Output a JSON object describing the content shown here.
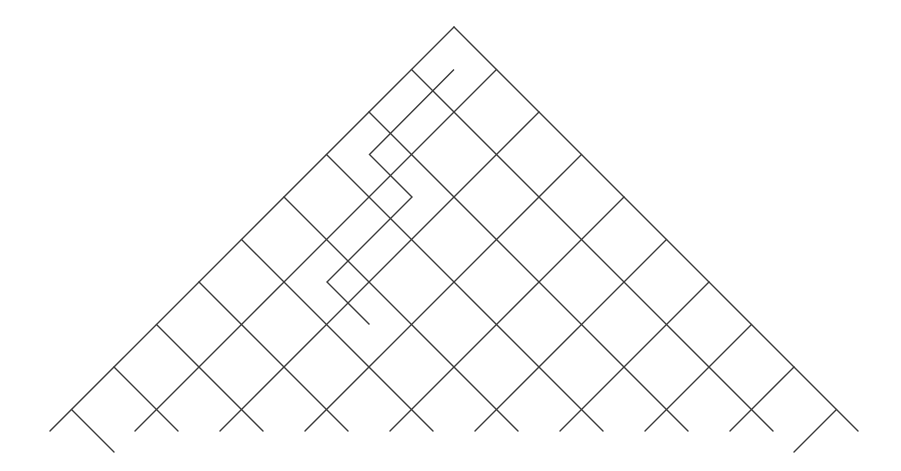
{
  "diagram": {
    "type": "lattice-path-triangle",
    "background": "#ffffff",
    "line_color": "#3a3a3a",
    "apex": [
      454,
      27
    ],
    "step": 42.5,
    "levels": 9,
    "cut_y": 431,
    "extended_nodes": {
      "left": 9,
      "right": 9,
      "extra_steps": 1
    },
    "path": [
      [
        454,
        69.5
      ],
      [
        369.5,
        154.5
      ],
      [
        412,
        197
      ],
      [
        327,
        282
      ],
      [
        369.5,
        324.5
      ]
    ]
  }
}
